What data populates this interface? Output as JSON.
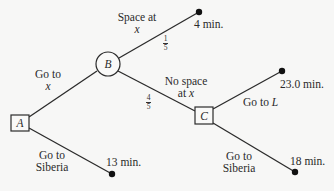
{
  "diagram": {
    "type": "decision-tree",
    "nodes": {
      "A": {
        "label": "A",
        "shape": "square",
        "kind": "decision"
      },
      "B": {
        "label": "B",
        "shape": "circle",
        "kind": "chance"
      },
      "C": {
        "label": "C",
        "shape": "square",
        "kind": "decision"
      }
    },
    "edges": {
      "a_to_b": {
        "line1": "Go to",
        "line2": "x"
      },
      "a_to_siberia": {
        "line1": "Go to",
        "line2": "Siberia"
      },
      "b_space": {
        "line1": "Space at",
        "line2": "x",
        "prob_num": "1",
        "prob_den": "5"
      },
      "b_no_space": {
        "line1": "No space",
        "line2_prefix": "at ",
        "line2_var": "x",
        "prob_num": "4",
        "prob_den": "5"
      },
      "c_to_l": {
        "text": "Go to ",
        "var": "L"
      },
      "c_to_siberia": {
        "line1": "Go to",
        "line2": "Siberia"
      }
    },
    "outcomes": {
      "space_at_x": "4 min.",
      "go_to_l": "23.0 min.",
      "a_siberia": "13 min.",
      "c_siberia": "18 min."
    }
  }
}
